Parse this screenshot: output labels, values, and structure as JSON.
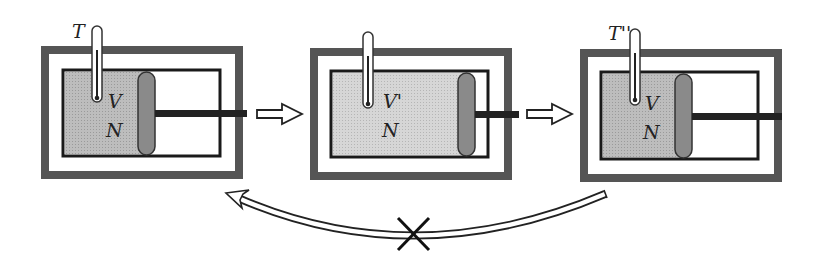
{
  "diagram": {
    "states": [
      {
        "id": "initial",
        "temperature_label": "T",
        "volume_label": "V",
        "particles_label": "N"
      },
      {
        "id": "expanded",
        "temperature_label": "",
        "volume_label": "V'",
        "particles_label": "N"
      },
      {
        "id": "final",
        "temperature_label": "T''",
        "volume_label": "V",
        "particles_label": "N"
      }
    ],
    "arrows": [
      {
        "from": "initial",
        "to": "expanded",
        "type": "forward"
      },
      {
        "from": "expanded",
        "to": "final",
        "type": "forward"
      },
      {
        "from": "final",
        "to": "initial",
        "type": "reverse-forbidden",
        "marker": "X"
      }
    ],
    "colors": {
      "insulation": "#555555",
      "gas": "#bdbdbd",
      "gas_light": "#d4d4d4",
      "piston": "#8a8a8a",
      "outline": "#1a1a1a"
    }
  }
}
